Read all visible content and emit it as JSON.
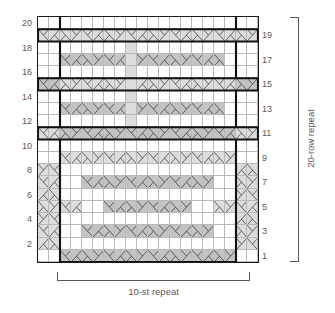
{
  "chart_title": "Knitting Stitch Chart",
  "chart_data": {
    "type": "heatmap",
    "title": "",
    "xlabel": "10-st repeat",
    "ylabel": "20-row repeat",
    "columns": 20,
    "rows": 20,
    "grid": true,
    "legend_position": "none",
    "row_numbers_left": [
      "20",
      "18",
      "16",
      "14",
      "12",
      "10",
      "8",
      "6",
      "4",
      "2"
    ],
    "row_numbers_right": [
      "19",
      "17",
      "15",
      "13",
      "11",
      "9",
      "7",
      "5",
      "3",
      "1"
    ],
    "stitch_repeat_label": "10-st repeat",
    "row_repeat_label": "20-row repeat",
    "stitch_repeat_count": 10,
    "row_repeat_count": 20,
    "colors": {
      "background": "#ffffff",
      "cell_white": "#ffffff",
      "cell_light": "#dcdcdc",
      "cell_mid": "#c3c3c3",
      "cell_dark": "#b0b0b0",
      "gridline": "#b9b9b9",
      "frame": "#1a1a1a",
      "repeat_outline": "#111111",
      "symbol": "#2f2f2f",
      "text": "#58585a"
    },
    "cell_symbols": {
      "blank": "no-symbol",
      "right-twist": "right-leaning-twist",
      "left-twist": "left-leaning-twist",
      "cable": "cable-cross"
    },
    "rows_data": [
      {
        "row": 20,
        "cells": "wwwwwwwwwwwwwwwwwwww"
      },
      {
        "row": 19,
        "cells": "LLLLLLLLLLLLLLLLLLLL"
      },
      {
        "row": 18,
        "cells": "wwwwwwwwlwwwwwwwwwww"
      },
      {
        "row": 17,
        "cells": "wwMMMMMMlMMMMMMMMwww"
      },
      {
        "row": 16,
        "cells": "wwwwwwwwlwwwwwwwwwww"
      },
      {
        "row": 15,
        "cells": "MMLLLLLLlLLLLLLLLLMM"
      },
      {
        "row": 14,
        "cells": "wwwwwwwwlwwwwwwwwwww"
      },
      {
        "row": 13,
        "cells": "wwMMMMMMlMMMMMMMMwww"
      },
      {
        "row": 12,
        "cells": "wwwwwwwwlwwwwwwwwwww"
      },
      {
        "row": 11,
        "cells": "LLMMMMMMMMMMMMMMMMLL"
      },
      {
        "row": 10,
        "cells": "wwwwwwwwwwwwwwwwwwww"
      },
      {
        "row": 9,
        "cells": "wwLLLLLLLLLLLLLLLLww"
      },
      {
        "row": 8,
        "cells": "LLwwwwwwwwwwwwwwwwLL"
      },
      {
        "row": 7,
        "cells": "LLwwMMMMMMMMMMMMwwLL"
      },
      {
        "row": 6,
        "cells": "LLwwwwwwwwwwwwwwwwLL"
      },
      {
        "row": 5,
        "cells": "LLLLwwMMMMMMMMwwLLLL"
      },
      {
        "row": 4,
        "cells": "LLwwwwwwwwwwwwwwwwLL"
      },
      {
        "row": 3,
        "cells": "LLwwMMMMMMMMMMMMwwLL"
      },
      {
        "row": 2,
        "cells": "LLwwwwwwwwwwwwwwwwLL"
      },
      {
        "row": 1,
        "cells": "wwMMMMMMMMMMMMMMMMww"
      }
    ]
  }
}
